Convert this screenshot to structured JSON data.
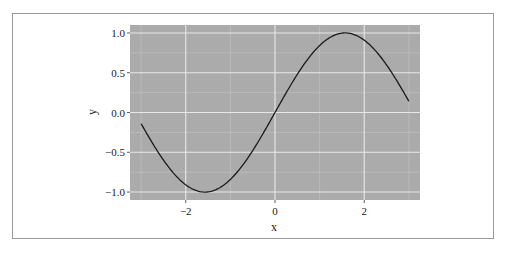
{
  "chart_data": {
    "type": "line",
    "title": "",
    "xlabel": "x",
    "ylabel": "y",
    "xlim": [
      -3.25,
      3.25
    ],
    "ylim": [
      -1.1,
      1.1
    ],
    "x_ticks": [
      -2,
      0,
      2
    ],
    "x_tick_labels": [
      "−2",
      "0",
      "2"
    ],
    "y_ticks": [
      1.0,
      0.5,
      0.0,
      -0.5,
      -1.0
    ],
    "y_tick_labels": [
      "1.0",
      "0.5",
      "0.0",
      "−0.5",
      "−1.0"
    ],
    "grid": true,
    "legend": null,
    "series": [
      {
        "name": "sin(x)",
        "function": "y = sin(x)",
        "x_range": [
          -3.0,
          3.0
        ],
        "x": [
          -3.0,
          -2.5,
          -2.0,
          -1.5708,
          -1.0,
          -0.5,
          0.0,
          0.5,
          1.0,
          1.5708,
          2.0,
          2.5,
          3.0
        ],
        "values": [
          -0.141,
          -0.598,
          -0.909,
          -1.0,
          -0.841,
          -0.479,
          0.0,
          0.479,
          0.841,
          1.0,
          0.909,
          0.598,
          0.141
        ]
      }
    ],
    "colors": {
      "panel_background": "#ababab",
      "grid_major": "#e8e8e8",
      "grid_minor": "#c4c4c4",
      "line": "#1a1a1a"
    }
  }
}
